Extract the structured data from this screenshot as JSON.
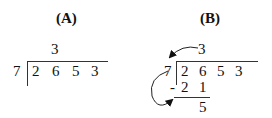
{
  "panel_a": {
    "label": "(A)",
    "divisor": "7",
    "dividend": [
      "2",
      "6",
      "5",
      "3"
    ],
    "quotient": "3"
  },
  "panel_b": {
    "label": "(B)",
    "divisor": "7",
    "dividend": [
      "2",
      "6",
      "5",
      "3"
    ],
    "quotient": "3",
    "minus": "-",
    "product": [
      "2",
      "1"
    ],
    "remainder": "5"
  }
}
